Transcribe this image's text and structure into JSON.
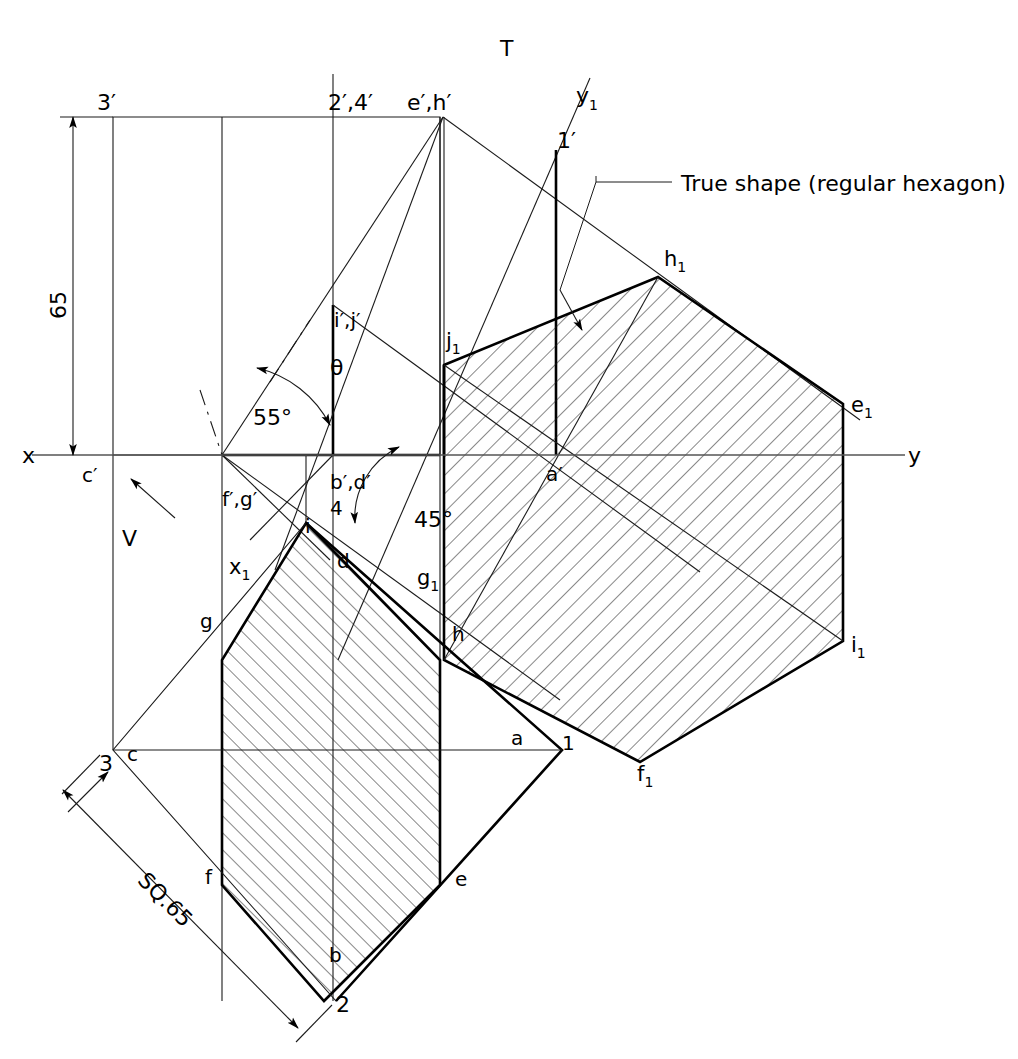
{
  "figure": {
    "type": "engineering-orthographic-projection",
    "caption": ""
  },
  "annotations": {
    "reference_line_left": "x",
    "reference_line_right": "y",
    "top_plane_label": "T",
    "vertical_plane_label": "V",
    "aux_ref_x": "x",
    "aux_ref_x_sub": "1",
    "aux_ref_y": "y",
    "aux_ref_y_sub": "1",
    "dimension_height": "65",
    "dimension_square": "SQ.65",
    "angle_section": "55°",
    "angle_theta": "θ",
    "angle_plan": "45°",
    "callout_true_shape": "True shape (regular hexagon)"
  },
  "front_view_labels": [
    {
      "text": "3′",
      "x": 97,
      "y": 110,
      "size": 22
    },
    {
      "text": "2′,4′",
      "x": 328,
      "y": 110,
      "size": 22
    },
    {
      "text": "e′,h′",
      "x": 407,
      "y": 110,
      "size": 22
    },
    {
      "text": "1′",
      "x": 557,
      "y": 148,
      "size": 22
    },
    {
      "text": "i′,j′",
      "x": 334,
      "y": 327,
      "size": 20
    },
    {
      "text": "c′",
      "x": 82,
      "y": 482,
      "size": 20
    },
    {
      "text": "f′,g′",
      "x": 222,
      "y": 506,
      "size": 20
    },
    {
      "text": "b′,d′",
      "x": 330,
      "y": 489,
      "size": 20
    },
    {
      "text": "4",
      "x": 330,
      "y": 515,
      "size": 20
    },
    {
      "text": "a′",
      "x": 546,
      "y": 481,
      "size": 20
    }
  ],
  "top_view_labels": [
    {
      "text": "i",
      "x": 305,
      "y": 533,
      "size": 20
    },
    {
      "text": "d",
      "x": 337,
      "y": 568,
      "size": 20
    },
    {
      "text": "g",
      "x": 200,
      "y": 628,
      "size": 20
    },
    {
      "text": "h",
      "x": 452,
      "y": 641,
      "size": 20
    },
    {
      "text": "a",
      "x": 511,
      "y": 745,
      "size": 20
    },
    {
      "text": "1",
      "x": 562,
      "y": 750,
      "size": 20
    },
    {
      "text": "c",
      "x": 127,
      "y": 761,
      "size": 20
    },
    {
      "text": "3",
      "x": 99,
      "y": 771,
      "size": 22
    },
    {
      "text": "e",
      "x": 455,
      "y": 886,
      "size": 20
    },
    {
      "text": "f",
      "x": 205,
      "y": 884,
      "size": 20
    },
    {
      "text": "b",
      "x": 329,
      "y": 962,
      "size": 20
    },
    {
      "text": "2",
      "x": 336,
      "y": 1012,
      "size": 22
    }
  ],
  "true_shape_labels": [
    {
      "base": "h",
      "sub": "1",
      "x": 664,
      "y": 266
    },
    {
      "base": "j",
      "sub": "1",
      "x": 446,
      "y": 348
    },
    {
      "base": "e",
      "sub": "1",
      "x": 851,
      "y": 412
    },
    {
      "base": "g",
      "sub": "1",
      "x": 417,
      "y": 585
    },
    {
      "base": "i",
      "sub": "1",
      "x": 851,
      "y": 652
    },
    {
      "base": "f",
      "sub": "1",
      "x": 637,
      "y": 781
    },
    {
      "base": "x",
      "sub": "1",
      "x": 229,
      "y": 574
    }
  ],
  "geometry": {
    "xy_line": {
      "x1": 32,
      "y1": 455,
      "x2": 905,
      "y2": 455
    },
    "front_view_rect": {
      "left": 113,
      "top": 117,
      "right": 440,
      "bottom": 455
    },
    "front_view_verticals": [
      113,
      222,
      333,
      440
    ],
    "hexagon_true_shape": [
      [
        444,
        365
      ],
      [
        658,
        277
      ],
      [
        843,
        404
      ],
      [
        843,
        641
      ],
      [
        640,
        762
      ],
      [
        444,
        660
      ]
    ],
    "top_view_polygon": [
      [
        306,
        523
      ],
      [
        440,
        660
      ],
      [
        440,
        885
      ],
      [
        324,
        1001
      ],
      [
        222,
        885
      ],
      [
        222,
        660
      ]
    ],
    "plan_square": [
      [
        562,
        750
      ],
      [
        336,
        1001
      ],
      [
        113,
        750
      ],
      [
        306,
        523
      ]
    ]
  },
  "colors": {
    "line": "#1a1a1a",
    "axis": "#555555",
    "background": "#ffffff",
    "hatch": "#1a1a1a"
  }
}
